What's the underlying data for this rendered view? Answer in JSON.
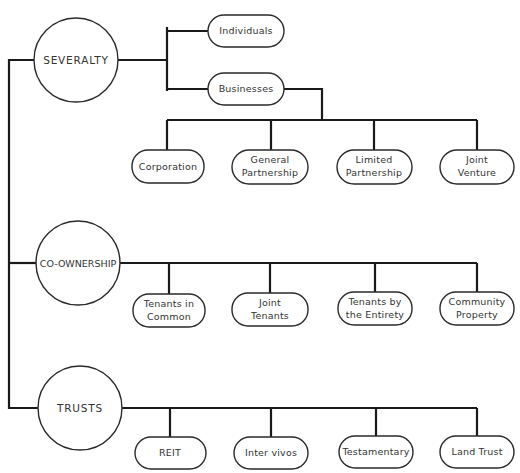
{
  "diagram": {
    "type": "ownership-classification-tree",
    "categories": [
      {
        "label": "SEVERALTY",
        "children": [
          {
            "label": "Individuals",
            "children": []
          },
          {
            "label": "Businesses",
            "children": [
              {
                "lines": [
                  "Corporation"
                ]
              },
              {
                "lines": [
                  "General",
                  "Partnership"
                ]
              },
              {
                "lines": [
                  "Limited",
                  "Partnership"
                ]
              },
              {
                "lines": [
                  "Joint",
                  "Venture"
                ]
              }
            ]
          }
        ]
      },
      {
        "label": "CO-OWNERSHIP",
        "children": [
          {
            "lines": [
              "Tenants in",
              "Common"
            ]
          },
          {
            "lines": [
              "Joint",
              "Tenants"
            ]
          },
          {
            "lines": [
              "Tenants by",
              "the Entirety"
            ]
          },
          {
            "lines": [
              "Community",
              "Property"
            ]
          }
        ]
      },
      {
        "label": "TRUSTS",
        "children": [
          {
            "lines": [
              "REIT"
            ]
          },
          {
            "lines": [
              "Inter vivos"
            ]
          },
          {
            "lines": [
              "Testamentary"
            ]
          },
          {
            "lines": [
              "Land Trust"
            ]
          }
        ]
      }
    ]
  }
}
